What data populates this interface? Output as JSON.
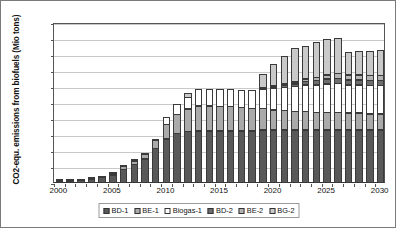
{
  "chart_data": {
    "type": "bar",
    "stacked": true,
    "title": "",
    "xlabel": "",
    "ylabel": "CO2-equ. emissions from biofuels (Mio tons)",
    "ylim": [
      0,
      100
    ],
    "yticks": [
      0,
      10,
      20,
      30,
      40,
      50,
      60,
      70,
      80,
      90,
      100
    ],
    "grid": true,
    "legend_position": "bottom",
    "categories": [
      "2000",
      "2001",
      "2002",
      "2003",
      "2004",
      "2005",
      "2006",
      "2007",
      "2008",
      "2009",
      "2010",
      "2011",
      "2012",
      "2013",
      "2014",
      "2015",
      "2016",
      "2017",
      "2018",
      "2019",
      "2020",
      "2021",
      "2022",
      "2023",
      "2024",
      "2025",
      "2026",
      "2027",
      "2028",
      "2029",
      "2030"
    ],
    "xtick_labels": [
      "2000",
      "2005",
      "2010",
      "2015",
      "2020",
      "2025",
      "2030"
    ],
    "xtick_categories": [
      "2000",
      "2005",
      "2010",
      "2015",
      "2020",
      "2025",
      "2030"
    ],
    "series": [
      {
        "name": "BD-1",
        "values": [
          1.2,
          1.2,
          1.8,
          2.5,
          3.5,
          5.0,
          8.5,
          11.5,
          15.0,
          21.5,
          27.5,
          31.0,
          32.0,
          32.5,
          32.5,
          32.5,
          32.5,
          32.5,
          32.5,
          33.0,
          33.0,
          33.0,
          33.0,
          33.0,
          33.0,
          33.0,
          33.0,
          33.0,
          33.0,
          33.0,
          33.0
        ]
      },
      {
        "name": "BE-1",
        "values": [
          0.3,
          0.3,
          0.3,
          0.5,
          0.8,
          1.3,
          2.0,
          2.5,
          3.0,
          5.5,
          9.5,
          12.0,
          14.5,
          16.0,
          16.0,
          15.5,
          15.5,
          15.0,
          14.5,
          14.0,
          13.0,
          12.5,
          12.0,
          12.0,
          11.5,
          11.5,
          11.5,
          11.0,
          11.0,
          10.5,
          10.5
        ]
      },
      {
        "name": "Biogas-1",
        "values": [
          0.0,
          0.0,
          0.0,
          0.0,
          0.0,
          0.3,
          0.5,
          0.8,
          0.5,
          0.5,
          4.5,
          7.0,
          7.5,
          10.5,
          10.5,
          11.0,
          11.0,
          11.0,
          11.5,
          12.5,
          14.0,
          15.0,
          16.0,
          17.0,
          17.5,
          18.0,
          18.5,
          18.0,
          18.0,
          18.0,
          18.0
        ]
      },
      {
        "name": "BD-2",
        "values": [
          0.0,
          0.0,
          0.0,
          0.0,
          0.0,
          0.0,
          0.0,
          0.0,
          0.0,
          0.0,
          0.0,
          0.0,
          0.0,
          0.0,
          0.0,
          0.0,
          0.0,
          0.0,
          0.0,
          0.5,
          1.0,
          1.5,
          2.0,
          2.5,
          3.0,
          3.5,
          3.5,
          3.5,
          3.5,
          3.5,
          3.5
        ]
      },
      {
        "name": "BE-2",
        "values": [
          0.0,
          0.0,
          0.0,
          0.0,
          0.0,
          0.0,
          0.0,
          0.0,
          0.0,
          0.0,
          0.0,
          0.0,
          0.0,
          0.0,
          0.0,
          0.0,
          0.0,
          0.0,
          0.0,
          0.0,
          0.5,
          1.0,
          1.5,
          2.0,
          2.5,
          3.0,
          3.5,
          3.5,
          3.5,
          3.5,
          3.5
        ]
      },
      {
        "name": "BG-2",
        "values": [
          0.0,
          0.0,
          0.0,
          0.0,
          0.0,
          0.0,
          0.0,
          0.0,
          0.0,
          0.0,
          0.0,
          0.0,
          3.0,
          0.0,
          0.0,
          0.0,
          0.0,
          0.0,
          0.0,
          8.5,
          13.5,
          18.0,
          21.5,
          21.0,
          22.5,
          22.5,
          22.5,
          14.5,
          15.0,
          15.5,
          16.0
        ]
      }
    ],
    "series_colors": [
      "#595959",
      "#aaaaaa",
      "#ffffff",
      "#6e6e6e",
      "#b4b4b4",
      "#c9c9c9"
    ],
    "totals": [
      1.5,
      1.5,
      2.1,
      3.0,
      4.3,
      6.6,
      11.0,
      14.8,
      18.5,
      27.5,
      41.5,
      50.0,
      57.0,
      59.0,
      59.0,
      59.0,
      59.0,
      58.5,
      58.5,
      68.5,
      75.0,
      81.0,
      86.0,
      87.5,
      90.0,
      91.5,
      92.5,
      83.5,
      84.0,
      84.0,
      84.5
    ]
  },
  "legend": {
    "items": [
      {
        "label": "BD-1"
      },
      {
        "label": "BE-1"
      },
      {
        "label": "Biogas-1"
      },
      {
        "label": "BD-2"
      },
      {
        "label": "BE-2"
      },
      {
        "label": "BG-2"
      }
    ]
  }
}
